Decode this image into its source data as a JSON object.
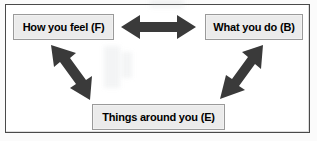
{
  "diagram": {
    "background_color": "#ffffff",
    "frame_color": "#4a4a4a",
    "node_fill_color": "#ebebeb",
    "node_border_color": "#9a9a9a",
    "arrow_color": "#3a3a3a",
    "text_color": "#000000",
    "nodes": [
      {
        "id": "feel",
        "label": "How you feel (F)"
      },
      {
        "id": "do",
        "label": "What you do (B)"
      },
      {
        "id": "env",
        "label": "Things around you (E)"
      }
    ],
    "connectors": [
      {
        "id": "feel-do",
        "from": "feel",
        "to": "do",
        "style": "double-headed",
        "orientation": "horizontal"
      },
      {
        "id": "feel-env",
        "from": "feel",
        "to": "env",
        "style": "double-headed",
        "orientation": "diagonal-down-right"
      },
      {
        "id": "do-env",
        "from": "do",
        "to": "env",
        "style": "double-headed",
        "orientation": "diagonal-down-left"
      }
    ]
  }
}
